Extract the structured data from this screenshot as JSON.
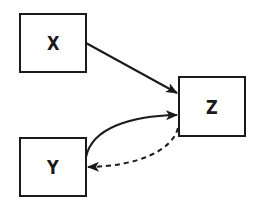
{
  "diagram": {
    "nodes": [
      {
        "id": "X",
        "label": "X"
      },
      {
        "id": "Z",
        "label": "Z"
      },
      {
        "id": "Y",
        "label": "Y"
      }
    ],
    "edges": [
      {
        "from": "X",
        "to": "Z",
        "style": "solid",
        "shape": "straight"
      },
      {
        "from": "Y",
        "to": "Z",
        "style": "solid",
        "shape": "curved"
      },
      {
        "from": "Z",
        "to": "Y",
        "style": "dashed",
        "shape": "curved"
      }
    ],
    "colors": {
      "stroke": "#1a1a1a",
      "background": "#ffffff"
    }
  }
}
